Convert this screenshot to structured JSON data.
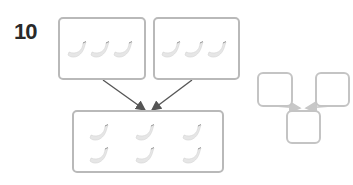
{
  "exercise": {
    "number": "10",
    "top_left_group": {
      "item": "banana",
      "count": 3
    },
    "top_right_group": {
      "item": "banana",
      "count": 3
    },
    "result_group": {
      "item": "banana",
      "count": 6
    },
    "answer_boxes": {
      "left": "",
      "right": "",
      "result": ""
    },
    "colors": {
      "box_border": "#b9b9b9",
      "arrow_dark": "#555555",
      "arrow_light": "#c8c8c8",
      "banana": "#e6e6e6"
    }
  }
}
